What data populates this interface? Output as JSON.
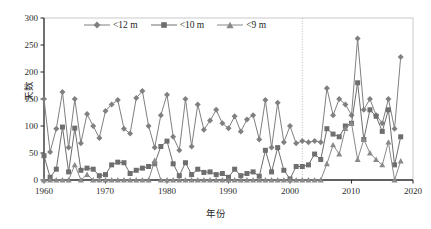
{
  "chart_data": {
    "type": "line",
    "title": "",
    "xlabel": "年份",
    "ylabel": "天数",
    "xlim": [
      1960,
      2020
    ],
    "ylim": [
      0,
      300
    ],
    "xticks": [
      "1960",
      "1970",
      "1980",
      "1990",
      "2000",
      "2010",
      "2020"
    ],
    "yticks": [
      "0",
      "50",
      "100",
      "150",
      "200",
      "250",
      "300"
    ],
    "grid": false,
    "legend_position": "top-center",
    "annotations": [
      {
        "type": "vertical-dotted-line",
        "x": 2002,
        "label": ""
      }
    ],
    "x": [
      1960,
      1961,
      1962,
      1963,
      1964,
      1965,
      1966,
      1967,
      1968,
      1969,
      1970,
      1971,
      1972,
      1973,
      1974,
      1975,
      1976,
      1977,
      1978,
      1979,
      1980,
      1981,
      1982,
      1983,
      1984,
      1985,
      1986,
      1987,
      1988,
      1989,
      1990,
      1991,
      1992,
      1993,
      1994,
      1995,
      1996,
      1997,
      1998,
      1999,
      2000,
      2001,
      2002,
      2003,
      2004,
      2005,
      2006,
      2007,
      2008,
      2009,
      2010,
      2011,
      2012,
      2013,
      2014,
      2015,
      2016,
      2017,
      2018
    ],
    "series": [
      {
        "name": "<12 m",
        "marker": "diamond",
        "color": "#808080",
        "values": [
          150,
          52,
          95,
          163,
          60,
          150,
          68,
          122,
          100,
          78,
          128,
          140,
          148,
          95,
          86,
          152,
          165,
          100,
          60,
          120,
          158,
          80,
          55,
          150,
          62,
          140,
          93,
          110,
          130,
          105,
          96,
          118,
          90,
          112,
          120,
          75,
          148,
          60,
          143,
          70,
          100,
          68,
          72,
          70,
          72,
          70,
          170,
          120,
          150,
          140,
          120,
          262,
          130,
          150,
          120,
          105,
          150,
          95,
          228
        ]
      },
      {
        "name": "<10 m",
        "marker": "square",
        "color": "#6e6e6e",
        "values": [
          45,
          5,
          20,
          98,
          15,
          96,
          18,
          22,
          20,
          8,
          10,
          28,
          33,
          32,
          12,
          18,
          22,
          25,
          30,
          62,
          72,
          30,
          8,
          32,
          10,
          20,
          14,
          15,
          10,
          12,
          5,
          20,
          8,
          12,
          15,
          7,
          55,
          15,
          60,
          18,
          2,
          25,
          25,
          28,
          48,
          38,
          95,
          85,
          80,
          100,
          105,
          180,
          75,
          130,
          118,
          90,
          130,
          28,
          80
        ]
      },
      {
        "name": "<9 m",
        "marker": "triangle",
        "color": "#8a8a8a",
        "values": [
          0,
          0,
          0,
          0,
          0,
          28,
          0,
          10,
          0,
          0,
          0,
          0,
          0,
          0,
          0,
          0,
          0,
          0,
          36,
          0,
          0,
          0,
          0,
          0,
          0,
          0,
          0,
          0,
          0,
          0,
          0,
          0,
          0,
          0,
          0,
          0,
          0,
          0,
          0,
          0,
          0,
          0,
          0,
          0,
          0,
          0,
          30,
          65,
          48,
          95,
          105,
          38,
          75,
          50,
          38,
          28,
          70,
          0,
          35
        ]
      }
    ]
  },
  "legend": {
    "items": [
      {
        "label": "<12 m"
      },
      {
        "label": "<10 m"
      },
      {
        "label": "<9 m"
      }
    ]
  }
}
